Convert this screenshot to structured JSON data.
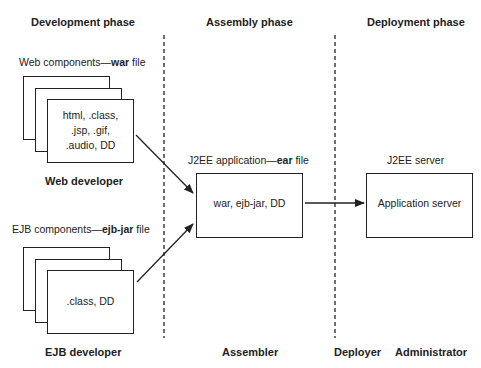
{
  "headers": {
    "development": "Development phase",
    "assembly": "Assembly phase",
    "deployment": "Deployment phase"
  },
  "web": {
    "caption_prefix": "Web components—",
    "caption_bold": "war",
    "caption_suffix": " file",
    "lines": [
      "html, .class,",
      ".jsp, .gif,",
      ".audio, DD"
    ],
    "role": "Web developer"
  },
  "ejb": {
    "caption_prefix": "EJB components—",
    "caption_bold": "ejb-jar",
    "caption_suffix": " file",
    "content": ".class, DD",
    "role": "EJB developer"
  },
  "ear": {
    "caption_prefix": "J2EE application—",
    "caption_bold": "ear",
    "caption_suffix": " file",
    "content": "war, ejb-jar, DD",
    "role": "Assembler"
  },
  "server": {
    "caption": "J2EE server",
    "content": "Application server",
    "roles": [
      "Deployer",
      "Administrator"
    ]
  },
  "colors": {
    "line": "#222222",
    "background": "#ffffff"
  }
}
